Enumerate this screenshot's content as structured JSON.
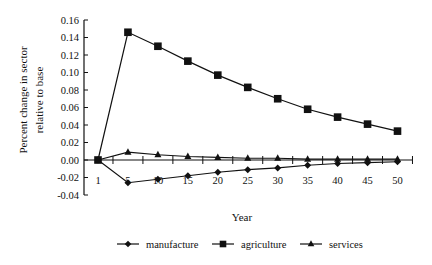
{
  "chart_data": {
    "type": "line",
    "title": "",
    "xlabel": "Year",
    "ylabel": "Percent change in sector relative to base",
    "ylabel_lines": [
      "Percent change in sector",
      "relative to base"
    ],
    "categories": [
      "1",
      "5",
      "10",
      "15",
      "20",
      "25",
      "30",
      "35",
      "40",
      "45",
      "50"
    ],
    "yticks": [
      "0.16",
      "0.14",
      "0.12",
      "0.10",
      "0.08",
      "0.06",
      "0.04",
      "0.02",
      "0.00",
      "-0.02",
      "-0.04"
    ],
    "ylim": [
      -0.04,
      0.16
    ],
    "grid": false,
    "legend_position": "bottom",
    "series": [
      {
        "name": "manufacture",
        "marker": "diamond",
        "values": [
          0.0,
          -0.026,
          -0.022,
          -0.018,
          -0.014,
          -0.011,
          -0.009,
          -0.006,
          -0.004,
          -0.003,
          -0.002
        ]
      },
      {
        "name": "agriculture",
        "marker": "square",
        "values": [
          0.0,
          0.146,
          0.13,
          0.113,
          0.097,
          0.083,
          0.07,
          0.058,
          0.049,
          0.041,
          0.033
        ]
      },
      {
        "name": "services",
        "marker": "triangle",
        "values": [
          0.0,
          0.009,
          0.006,
          0.004,
          0.003,
          0.002,
          0.002,
          0.001,
          0.001,
          0.001,
          0.001
        ]
      }
    ],
    "line_color": "#111111"
  }
}
